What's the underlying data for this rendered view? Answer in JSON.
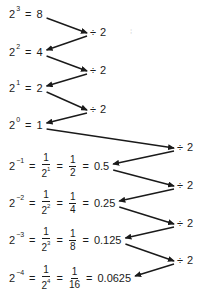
{
  "operator": {
    "symbol": "÷",
    "value": "2"
  },
  "rows": [
    {
      "base": "2",
      "exp": "3",
      "fractions": [],
      "value": "8"
    },
    {
      "base": "2",
      "exp": "2",
      "fractions": [],
      "value": "4"
    },
    {
      "base": "2",
      "exp": "1",
      "fractions": [],
      "value": "2"
    },
    {
      "base": "2",
      "exp": "0",
      "fractions": [],
      "value": "1"
    },
    {
      "base": "2",
      "exp": "−1",
      "fractions": [
        {
          "num": "1",
          "den_base": "2",
          "den_exp": "1"
        },
        {
          "num": "1",
          "den_base": "2",
          "den_exp": ""
        }
      ],
      "value": "0.5"
    },
    {
      "base": "2",
      "exp": "−2",
      "fractions": [
        {
          "num": "1",
          "den_base": "2",
          "den_exp": "2"
        },
        {
          "num": "1",
          "den_base": "4",
          "den_exp": ""
        }
      ],
      "value": "0.25"
    },
    {
      "base": "2",
      "exp": "−3",
      "fractions": [
        {
          "num": "1",
          "den_base": "2",
          "den_exp": "3"
        },
        {
          "num": "1",
          "den_base": "8",
          "den_exp": ""
        }
      ],
      "value": "0.125"
    },
    {
      "base": "2",
      "exp": "−4",
      "fractions": [
        {
          "num": "1",
          "den_base": "2",
          "den_exp": "4"
        },
        {
          "num": "1",
          "den_base": "16",
          "den_exp": ""
        }
      ],
      "value": "0.0625"
    }
  ],
  "equals": "="
}
